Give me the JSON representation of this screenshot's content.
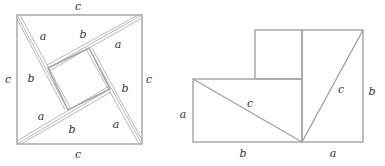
{
  "figure_left": {
    "title": "Four right triangles arranged inside a square of side c",
    "outer_square": {
      "label_top": "c",
      "label_bottom": "c",
      "label_left": "c",
      "label_right": "c"
    },
    "triangle_labels": [
      {
        "text": "a",
        "x": 41,
        "y": 39
      },
      {
        "text": "b",
        "x": 82,
        "y": 38
      },
      {
        "text": "a",
        "x": 118,
        "y": 48
      },
      {
        "text": "b",
        "x": 30,
        "y": 81
      },
      {
        "text": "b",
        "x": 124,
        "y": 92
      },
      {
        "text": "a",
        "x": 40,
        "y": 120
      },
      {
        "text": "b",
        "x": 71,
        "y": 132
      },
      {
        "text": "a",
        "x": 114,
        "y": 128
      }
    ],
    "side_labels": [
      {
        "text": "c",
        "x": 78,
        "y": 10
      },
      {
        "text": "c",
        "x": 78,
        "y": 158
      },
      {
        "text": "c",
        "x": 8,
        "y": 80
      },
      {
        "text": "c",
        "x": 149,
        "y": 80
      }
    ]
  },
  "figure_right": {
    "title": "Rearrangement into squares of side a and b",
    "labels": [
      {
        "text": "c",
        "x": 262,
        "y": 104,
        "role": "hypotenuse-left"
      },
      {
        "text": "c",
        "x": 339,
        "y": 91,
        "role": "hypotenuse-right"
      },
      {
        "text": "a",
        "x": 182,
        "y": 118,
        "role": "left-side"
      },
      {
        "text": "b",
        "x": 370,
        "y": 94,
        "role": "right-side"
      },
      {
        "text": "b",
        "x": 243,
        "y": 157,
        "role": "bottom-left"
      },
      {
        "text": "a",
        "x": 333,
        "y": 157,
        "role": "bottom-right"
      }
    ]
  },
  "colors": {
    "line": "#a3a3a3",
    "label": "#333333",
    "background": "#ffffff"
  }
}
